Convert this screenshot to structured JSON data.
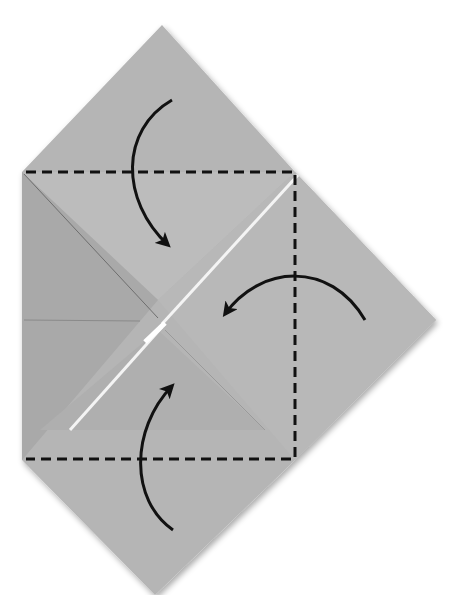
{
  "diagram": {
    "type": "origami-fold-step",
    "colors": {
      "background": "#ffffff",
      "paper": "#b5b5b5",
      "paper_light": "#bebebe",
      "paper_dark": "#a6a6a6",
      "crease": "#6e6e6e",
      "gap": "#f2f2f2",
      "line": "#111111"
    },
    "fold_lines": [
      {
        "name": "top-dashed-line",
        "style": "dashed"
      },
      {
        "name": "right-dashed-line",
        "style": "dashed"
      },
      {
        "name": "bottom-dashed-line",
        "style": "dashed"
      }
    ],
    "arrows": [
      {
        "name": "arrow-fold-top-corner",
        "direction": "down"
      },
      {
        "name": "arrow-fold-right-corner",
        "direction": "left"
      },
      {
        "name": "arrow-fold-bottom-corner",
        "direction": "up"
      }
    ]
  }
}
